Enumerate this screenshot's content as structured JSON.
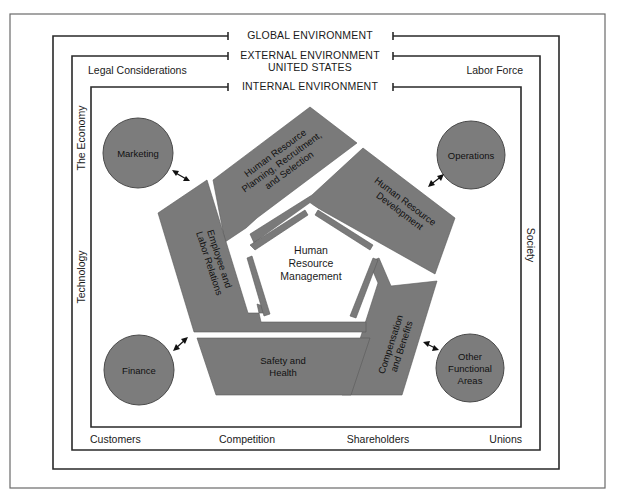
{
  "environments": {
    "global": "GLOBAL ENVIRONMENT",
    "external": "EXTERNAL ENVIRONMENT",
    "external_sub": "UNITED STATES",
    "internal": "INTERNAL ENVIRONMENT"
  },
  "external_factors": {
    "top_left": "Legal Considerations",
    "top_right": "Labor Force",
    "left_top": "The Economy",
    "left_bottom": "Technology",
    "right": "Society",
    "bottom": [
      "Customers",
      "Competition",
      "Shareholders",
      "Unions"
    ]
  },
  "functional_areas": {
    "marketing": "Marketing",
    "operations": "Operations",
    "finance": "Finance",
    "other": [
      "Other",
      "Functional",
      "Areas"
    ]
  },
  "hrm_segments": {
    "planning": [
      "Human Resource",
      "Planning, Recruitment,",
      "and Selection"
    ],
    "development": [
      "Human Resource",
      "Development"
    ],
    "compensation": [
      "Compensation",
      "and Benefits"
    ],
    "safety": [
      "Safety and",
      "Health"
    ],
    "employee": [
      "Employee and",
      "Labor Relations"
    ]
  },
  "center": [
    "Human",
    "Resource",
    "Management"
  ],
  "colors": {
    "segment_fill": "#7a7a7a",
    "circle_fill": "#7c7c7c",
    "line": "#2a2a2a"
  }
}
